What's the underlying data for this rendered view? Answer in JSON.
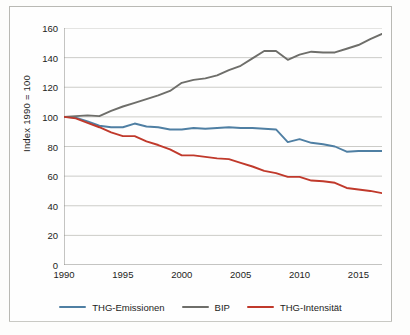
{
  "chart_data": {
    "type": "line",
    "title": "",
    "xlabel": "",
    "ylabel": "Index 1990 = 100",
    "xlim": [
      1990,
      2017
    ],
    "ylim": [
      0,
      160
    ],
    "yticks": [
      0,
      20,
      40,
      60,
      80,
      100,
      120,
      140,
      160
    ],
    "xticks": [
      1990,
      1995,
      2000,
      2005,
      2010,
      2015
    ],
    "xtick_labels": [
      "1990",
      "1995",
      "2000",
      "2005",
      "2010",
      "2015"
    ],
    "ytick_labels": [
      "0",
      "20",
      "40",
      "60",
      "80",
      "100",
      "120",
      "140",
      "160"
    ],
    "grid": "horizontal",
    "legend_position": "bottom",
    "x": [
      1990,
      1991,
      1992,
      1993,
      1994,
      1995,
      1996,
      1997,
      1998,
      1999,
      2000,
      2001,
      2002,
      2003,
      2004,
      2005,
      2006,
      2007,
      2008,
      2009,
      2010,
      2011,
      2012,
      2013,
      2014,
      2015,
      2016,
      2017
    ],
    "series": [
      {
        "name": "THG-Emissionen",
        "color": "#4f7fa3",
        "values": [
          100,
          99.5,
          97,
          94,
          93,
          93,
          95.5,
          93.5,
          93,
          91.5,
          91.5,
          92.5,
          92,
          92.5,
          93,
          92.5,
          92.5,
          92,
          91.5,
          83,
          85,
          82.5,
          81.5,
          80,
          76.5,
          77,
          77,
          77
        ]
      },
      {
        "name": "BIP",
        "color": "#6e6e6a",
        "values": [
          100,
          100.5,
          101,
          100.5,
          104,
          107,
          109.5,
          112,
          114.5,
          117.5,
          123,
          125,
          126,
          128,
          131.5,
          134.5,
          139.5,
          144.5,
          144.5,
          138.5,
          142,
          144,
          143.5,
          143.5,
          146,
          148.5,
          152.5,
          156
        ]
      },
      {
        "name": "THG-Intensität",
        "color": "#c0392b",
        "values": [
          100,
          99,
          96,
          93,
          89.5,
          87,
          87,
          83.5,
          81,
          78,
          74,
          74,
          73,
          72,
          71.5,
          69,
          66.5,
          63.5,
          62,
          59.5,
          59.5,
          57,
          56.5,
          55.5,
          52,
          51,
          50,
          48.5
        ]
      }
    ]
  },
  "legend": {
    "items": [
      {
        "label": "THG-Emissionen",
        "color": "#4f7fa3"
      },
      {
        "label": "BIP",
        "color": "#6e6e6a"
      },
      {
        "label": "THG-Intensität",
        "color": "#c0392b"
      }
    ]
  },
  "axes": {
    "y_title": "Index 1990 = 100"
  },
  "colors": {
    "blue": "#4f7fa3",
    "gray": "#6e6e6a",
    "red": "#c0392b",
    "gridline": "#c6c6c2",
    "axis": "#8a8a86",
    "frame": "#b9b9b4",
    "text": "#1d1d1b",
    "background": "#fefefe"
  }
}
